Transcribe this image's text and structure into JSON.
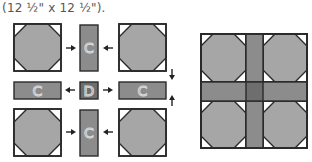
{
  "caption": "(12 ½\" x 12 ½\").",
  "colors": {
    "octagon": "#a6a6a6",
    "strip": "#8c8c8c",
    "center": "#6e6e6e",
    "outline": "#2a2a2a",
    "corner": "#ffffff",
    "letter_stroke": "#d8d8d8"
  },
  "diagram": {
    "strip_label": "C",
    "center_label": "D",
    "pieces": [
      {
        "type": "octagon",
        "row": 0,
        "col": 0
      },
      {
        "type": "strip-vertical",
        "row": 0,
        "col": 1,
        "label": "C"
      },
      {
        "type": "octagon",
        "row": 0,
        "col": 2
      },
      {
        "type": "strip-horizontal",
        "row": 1,
        "col": 0,
        "label": "C"
      },
      {
        "type": "center-square",
        "row": 1,
        "col": 1,
        "label": "D"
      },
      {
        "type": "strip-horizontal",
        "row": 1,
        "col": 2,
        "label": "C"
      },
      {
        "type": "octagon",
        "row": 2,
        "col": 0
      },
      {
        "type": "strip-vertical",
        "row": 2,
        "col": 1,
        "label": "C"
      },
      {
        "type": "octagon",
        "row": 2,
        "col": 2
      }
    ],
    "arrows": [
      {
        "dir": "right",
        "row": 0,
        "between": "octagon-to-strip"
      },
      {
        "dir": "left",
        "row": 0,
        "between": "octagon-to-strip"
      },
      {
        "dir": "left",
        "row": 1,
        "between": "center-to-strip"
      },
      {
        "dir": "right",
        "row": 1,
        "between": "center-to-strip"
      },
      {
        "dir": "right",
        "row": 2,
        "between": "octagon-to-strip"
      },
      {
        "dir": "left",
        "row": 2,
        "between": "octagon-to-strip"
      },
      {
        "dir": "down",
        "side": "right",
        "between": "top-row-to-middle"
      },
      {
        "dir": "up",
        "side": "right",
        "between": "bottom-row-to-middle"
      }
    ],
    "assembled_block": "finished block with four octagons, sashing strips and center square"
  }
}
